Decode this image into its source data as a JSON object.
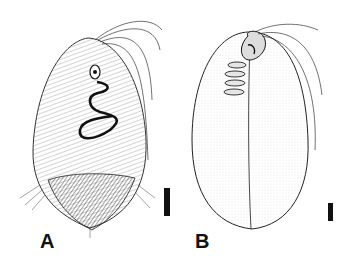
{
  "figure": {
    "panels": [
      {
        "label": "A",
        "description": "Hairy ciliate cell, ventral view, with spiral adoral zone and coarser posterior region",
        "scale_bar": "vertical bar"
      },
      {
        "label": "B",
        "description": "Smooth stippled ovoid cell with oral apparatus and longitudinal suture",
        "scale_bar": "vertical bar"
      }
    ],
    "colors": {
      "ink": "#111111",
      "background": "#ffffff",
      "stipple": "#e8e8e8"
    }
  }
}
